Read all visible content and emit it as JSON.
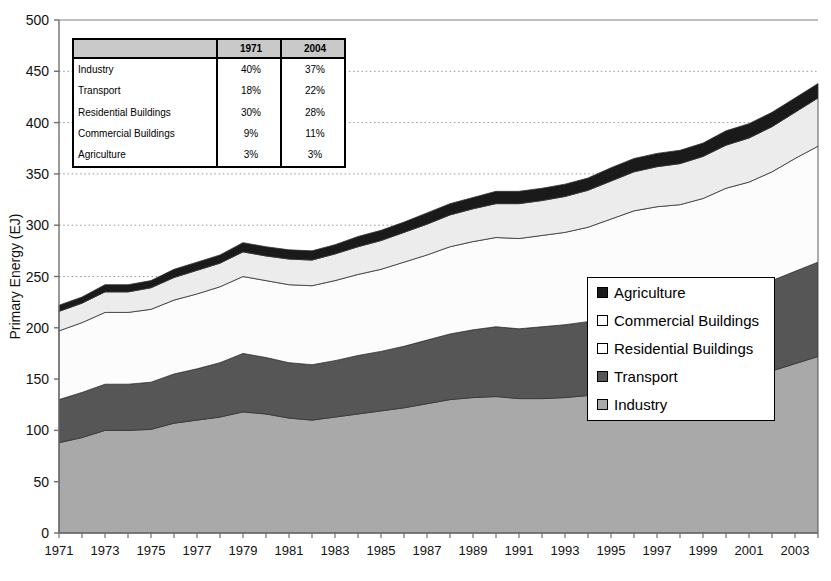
{
  "chart_data": {
    "type": "area",
    "title": "",
    "xlabel": "",
    "ylabel": "Primary Energy (EJ)",
    "ylim": [
      0,
      500
    ],
    "ytick_step": 50,
    "yticks": [
      "0",
      "50",
      "100",
      "150",
      "200",
      "250",
      "300",
      "350",
      "400",
      "450",
      "500"
    ],
    "grid": true,
    "stacked": true,
    "legend_position": "middle-right",
    "x": [
      1971,
      1972,
      1973,
      1974,
      1975,
      1976,
      1977,
      1978,
      1979,
      1980,
      1981,
      1982,
      1983,
      1984,
      1985,
      1986,
      1987,
      1988,
      1989,
      1990,
      1991,
      1992,
      1993,
      1994,
      1995,
      1996,
      1997,
      1998,
      1999,
      2000,
      2001,
      2002,
      2003,
      2004
    ],
    "xtick_labels": [
      "1971",
      "1973",
      "1975",
      "1977",
      "1979",
      "1981",
      "1983",
      "1985",
      "1987",
      "1989",
      "1991",
      "1993",
      "1995",
      "1997",
      "1999",
      "2001",
      "2003"
    ],
    "series": [
      {
        "name": "Industry",
        "color": "#a9a9a9",
        "values": [
          88,
          93,
          100,
          100,
          101,
          107,
          110,
          113,
          118,
          116,
          112,
          110,
          113,
          116,
          119,
          122,
          126,
          130,
          132,
          133,
          131,
          131,
          132,
          134,
          138,
          142,
          143,
          142,
          144,
          150,
          152,
          158,
          165,
          172
        ]
      },
      {
        "name": "Transport",
        "color": "#565656",
        "values": [
          42,
          44,
          45,
          45,
          46,
          48,
          50,
          53,
          57,
          55,
          54,
          54,
          55,
          57,
          58,
          60,
          62,
          64,
          66,
          68,
          68,
          70,
          71,
          72,
          74,
          76,
          78,
          80,
          82,
          84,
          86,
          88,
          90,
          92
        ]
      },
      {
        "name": "Residential Buildings",
        "color": "#fcfcfc",
        "values": [
          67,
          68,
          70,
          70,
          71,
          72,
          73,
          74,
          75,
          75,
          76,
          77,
          78,
          79,
          80,
          82,
          83,
          85,
          86,
          87,
          88,
          89,
          90,
          92,
          94,
          96,
          97,
          98,
          100,
          102,
          104,
          106,
          110,
          113
        ]
      },
      {
        "name": "Commercial Buildings",
        "color": "#ececec",
        "values": [
          19,
          19,
          20,
          20,
          21,
          22,
          23,
          23,
          24,
          24,
          25,
          25,
          26,
          27,
          28,
          29,
          30,
          31,
          32,
          33,
          34,
          34,
          35,
          36,
          37,
          38,
          39,
          40,
          41,
          42,
          43,
          44,
          45,
          47
        ]
      },
      {
        "name": "Agriculture",
        "color": "#1a1a1a",
        "values": [
          6,
          6,
          7,
          7,
          7,
          8,
          8,
          8,
          9,
          9,
          9,
          9,
          9,
          10,
          10,
          10,
          11,
          11,
          11,
          12,
          12,
          12,
          12,
          12,
          13,
          13,
          13,
          13,
          13,
          14,
          14,
          14,
          14,
          14
        ]
      }
    ],
    "totals": [
      222,
      230,
      242,
      242,
      246,
      257,
      264,
      271,
      283,
      279,
      276,
      275,
      281,
      289,
      295,
      303,
      312,
      321,
      327,
      333,
      333,
      336,
      340,
      346,
      356,
      365,
      370,
      373,
      380,
      392,
      399,
      410,
      424,
      438
    ]
  },
  "legend": {
    "entries": [
      {
        "label": "Agriculture",
        "color": "#1a1a1a"
      },
      {
        "label": "Commercial Buildings",
        "color": "#ffffff"
      },
      {
        "label": "Residential Buildings",
        "color": "#ffffff"
      },
      {
        "label": "Transport",
        "color": "#565656"
      },
      {
        "label": "Industry",
        "color": "#a9a9a9"
      }
    ]
  },
  "data_table": {
    "header_blank": "",
    "columns": [
      "1971",
      "2004"
    ],
    "rows": [
      {
        "label": "Industry",
        "v1971": "40%",
        "v2004": "37%"
      },
      {
        "label": "Transport",
        "v1971": "18%",
        "v2004": "22%"
      },
      {
        "label": "Residential Buildings",
        "v1971": "30%",
        "v2004": "28%"
      },
      {
        "label": "Commercial Buildings",
        "v1971": "9%",
        "v2004": "11%"
      },
      {
        "label": "Agriculture",
        "v1971": "3%",
        "v2004": "3%"
      }
    ]
  }
}
